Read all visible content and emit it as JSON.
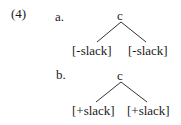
{
  "example": {
    "number": "(4)",
    "items": [
      {
        "label": "a.",
        "root": "c",
        "children": [
          "[-slack]",
          "[-slack]"
        ]
      },
      {
        "label": "b.",
        "root": "c",
        "children": [
          "[+slack]",
          "[+slack]"
        ]
      }
    ]
  }
}
